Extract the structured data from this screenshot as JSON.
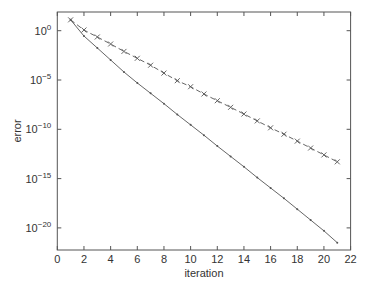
{
  "chart_data": {
    "type": "line",
    "title": "",
    "xlabel": "iteration",
    "ylabel": "error",
    "yscale": "log",
    "xlim": [
      0,
      22
    ],
    "ylim_log10": [
      -22.2,
      1.9
    ],
    "xticks": [
      0,
      2,
      4,
      6,
      8,
      10,
      12,
      14,
      16,
      18,
      20,
      22
    ],
    "yticks_log10": [
      0,
      -5,
      -10,
      -15,
      -20
    ],
    "ytick_labels": [
      "10^0",
      "10^-5",
      "10^-10",
      "10^-15",
      "10^-20"
    ],
    "grid": false,
    "legend": null,
    "x": [
      1,
      2,
      3,
      4,
      5,
      6,
      7,
      8,
      9,
      10,
      11,
      12,
      13,
      14,
      15,
      16,
      17,
      18,
      19,
      20,
      21
    ],
    "series": [
      {
        "name": "dashed-x",
        "style": "dashed",
        "marker": "x",
        "color": "#555555",
        "log10_values": [
          1.1,
          0.07,
          -0.64,
          -1.35,
          -2.1,
          -2.8,
          -3.5,
          -4.3,
          -5.07,
          -5.68,
          -6.42,
          -7.1,
          -7.77,
          -8.45,
          -9.15,
          -9.85,
          -10.5,
          -11.2,
          -11.9,
          -12.6,
          -13.3
        ]
      },
      {
        "name": "solid-dot",
        "style": "solid",
        "marker": "dot",
        "color": "#555555",
        "log10_values": [
          1.1,
          -0.54,
          -1.75,
          -2.97,
          -4.19,
          -5.3,
          -6.35,
          -7.4,
          -8.5,
          -9.55,
          -10.6,
          -11.7,
          -12.75,
          -13.8,
          -14.9,
          -15.95,
          -17.0,
          -18.1,
          -19.2,
          -20.3,
          -21.5
        ]
      }
    ]
  },
  "axes": {
    "xlabel": "iteration",
    "ylabel": "error"
  }
}
